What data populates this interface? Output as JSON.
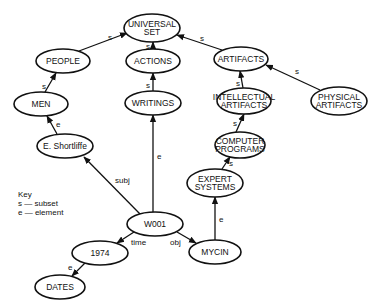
{
  "diagram": {
    "nodes": [
      {
        "id": "universal_set",
        "lines": [
          "UNIVERSAL",
          "SET"
        ],
        "cx": 152,
        "cy": 28,
        "rx": 28,
        "ry": 14
      },
      {
        "id": "people",
        "lines": [
          "PEOPLE"
        ],
        "cx": 63,
        "cy": 61,
        "rx": 27,
        "ry": 12
      },
      {
        "id": "actions",
        "lines": [
          "ACTIONS"
        ],
        "cx": 153,
        "cy": 61,
        "rx": 27,
        "ry": 12
      },
      {
        "id": "artifacts",
        "lines": [
          "ARTIFACTS"
        ],
        "cx": 241,
        "cy": 59,
        "rx": 27,
        "ry": 12
      },
      {
        "id": "men",
        "lines": [
          "MEN"
        ],
        "cx": 41,
        "cy": 104,
        "rx": 27,
        "ry": 12
      },
      {
        "id": "writings",
        "lines": [
          "WRITINGS"
        ],
        "cx": 153,
        "cy": 103,
        "rx": 28,
        "ry": 12
      },
      {
        "id": "intellectual_artifacts",
        "lines": [
          "INTELLECTUAL",
          "ARTIFACTS"
        ],
        "cx": 244,
        "cy": 101,
        "rx": 27,
        "ry": 13
      },
      {
        "id": "physical_artifacts",
        "lines": [
          "PHYSICAL",
          "ARTIFACTS"
        ],
        "cx": 339,
        "cy": 101,
        "rx": 28,
        "ry": 14
      },
      {
        "id": "computer_programs",
        "lines": [
          "COMPUTER",
          "PROGRAMS"
        ],
        "cx": 240,
        "cy": 145,
        "rx": 25,
        "ry": 13
      },
      {
        "id": "e_shortliffe",
        "lines": [
          "E. Shortliffe"
        ],
        "cx": 65,
        "cy": 146,
        "rx": 28,
        "ry": 12
      },
      {
        "id": "expert_systems",
        "lines": [
          "EXPERT",
          "SYSTEMS"
        ],
        "cx": 215,
        "cy": 183,
        "rx": 28,
        "ry": 14
      },
      {
        "id": "w001",
        "lines": [
          "W001"
        ],
        "cx": 155,
        "cy": 224,
        "rx": 28,
        "ry": 12
      },
      {
        "id": "year_1974",
        "lines": [
          "1974"
        ],
        "cx": 100,
        "cy": 253,
        "rx": 28,
        "ry": 12
      },
      {
        "id": "mycin",
        "lines": [
          "MYCIN"
        ],
        "cx": 215,
        "cy": 252,
        "rx": 26,
        "ry": 12
      },
      {
        "id": "dates",
        "lines": [
          "DATES"
        ],
        "cx": 60,
        "cy": 287,
        "rx": 25,
        "ry": 12
      }
    ],
    "edges": [
      {
        "from": "people",
        "to": "universal_set",
        "label": "s",
        "x1": 79,
        "y1": 51,
        "x2": 127,
        "y2": 33,
        "lx": 108,
        "ly": 40
      },
      {
        "from": "actions",
        "to": "universal_set",
        "label": "s",
        "x1": 153,
        "y1": 49,
        "x2": 153,
        "y2": 42,
        "lx": 146,
        "ly": 49
      },
      {
        "from": "artifacts",
        "to": "universal_set",
        "label": "s",
        "x1": 222,
        "y1": 50,
        "x2": 177,
        "y2": 35,
        "lx": 200,
        "ly": 41
      },
      {
        "from": "men",
        "to": "people",
        "label": "s",
        "x1": 45,
        "y1": 92,
        "x2": 56,
        "y2": 73,
        "lx": 42,
        "ly": 89
      },
      {
        "from": "writings",
        "to": "actions",
        "label": "s",
        "x1": 153,
        "y1": 91,
        "x2": 153,
        "y2": 73,
        "lx": 146,
        "ly": 88
      },
      {
        "from": "intellectual_artifacts",
        "to": "artifacts",
        "label": "s",
        "x1": 243,
        "y1": 88,
        "x2": 240,
        "y2": 71,
        "lx": 236,
        "ly": 86
      },
      {
        "from": "physical_artifacts",
        "to": "artifacts",
        "label": "s",
        "x1": 320,
        "y1": 90,
        "x2": 266,
        "y2": 65,
        "lx": 295,
        "ly": 74
      },
      {
        "from": "computer_programs",
        "to": "intellectual_artifacts",
        "label": "s",
        "x1": 236,
        "y1": 132,
        "x2": 244,
        "y2": 114,
        "lx": 233,
        "ly": 126
      },
      {
        "from": "expert_systems",
        "to": "computer_programs",
        "label": "s",
        "x1": 222,
        "y1": 169,
        "x2": 230,
        "y2": 157,
        "lx": 229,
        "ly": 166
      },
      {
        "from": "e_shortliffe",
        "to": "men",
        "label": "e",
        "x1": 57,
        "y1": 134,
        "x2": 47,
        "y2": 116,
        "lx": 56,
        "ly": 127
      },
      {
        "from": "w001",
        "to": "e_shortliffe",
        "label": "subj",
        "x1": 140,
        "y1": 214,
        "x2": 84,
        "y2": 157,
        "lx": 115,
        "ly": 183
      },
      {
        "from": "w001",
        "to": "writings",
        "label": "e",
        "x1": 153,
        "y1": 212,
        "x2": 153,
        "y2": 115,
        "lx": 157,
        "ly": 159
      },
      {
        "from": "w001",
        "to": "year_1974",
        "label": "time",
        "x1": 134,
        "y1": 232,
        "x2": 117,
        "y2": 243,
        "lx": 131,
        "ly": 245
      },
      {
        "from": "w001",
        "to": "mycin",
        "label": "obj",
        "x1": 177,
        "y1": 232,
        "x2": 196,
        "y2": 243,
        "lx": 170,
        "ly": 245
      },
      {
        "from": "mycin",
        "to": "expert_systems",
        "label": "e",
        "x1": 215,
        "y1": 240,
        "x2": 215,
        "y2": 197,
        "lx": 219,
        "ly": 222
      },
      {
        "from": "year_1974",
        "to": "dates",
        "label": "e",
        "x1": 85,
        "y1": 263,
        "x2": 72,
        "y2": 276,
        "lx": 68,
        "ly": 270
      }
    ]
  },
  "key": {
    "title": "Key",
    "items": [
      {
        "symbol": "s",
        "meaning": "subset",
        "text": "s — subset"
      },
      {
        "symbol": "e",
        "meaning": "element",
        "text": "e — element"
      }
    ]
  }
}
